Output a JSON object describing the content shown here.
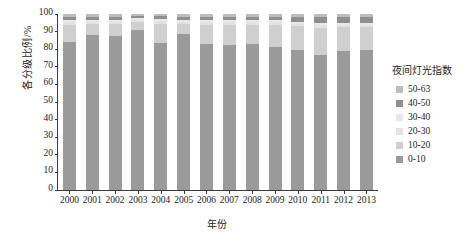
{
  "chart_data": {
    "type": "bar",
    "stacked": true,
    "title": "",
    "xlabel": "年份",
    "ylabel": "各分级比例/%",
    "ylim": [
      0,
      100
    ],
    "yticks": [
      0,
      10,
      20,
      30,
      40,
      50,
      60,
      70,
      80,
      90,
      100
    ],
    "grid": false,
    "legend_position": "right",
    "legend_title": "夜间灯光指数",
    "categories": [
      "2000",
      "2001",
      "2002",
      "2003",
      "2004",
      "2005",
      "2006",
      "2007",
      "2008",
      "2009",
      "2010",
      "2011",
      "2012",
      "2013"
    ],
    "series": [
      {
        "name": "0-10",
        "color": "#9a9a9a",
        "values": [
          84.0,
          88.0,
          87.5,
          91.0,
          83.5,
          88.5,
          83.0,
          82.5,
          83.0,
          81.5,
          79.5,
          76.5,
          79.0,
          79.5
        ]
      },
      {
        "name": "10-20",
        "color": "#cfcfcf",
        "values": [
          10.0,
          6.5,
          7.0,
          4.5,
          11.0,
          6.0,
          11.0,
          11.5,
          11.0,
          12.5,
          13.5,
          15.5,
          13.5,
          13.0
        ]
      },
      {
        "name": "20-30",
        "color": "#e2e2e2",
        "values": [
          1.5,
          1.0,
          1.0,
          1.0,
          1.5,
          1.0,
          1.5,
          1.5,
          1.5,
          1.5,
          1.5,
          2.0,
          1.5,
          1.5
        ]
      },
      {
        "name": "30-40",
        "color": "#e8e8e8",
        "values": [
          1.0,
          1.0,
          1.0,
          1.0,
          1.0,
          1.0,
          1.0,
          1.0,
          1.0,
          1.0,
          1.0,
          1.0,
          1.0,
          1.0
        ]
      },
      {
        "name": "40-50",
        "color": "#8f8f8f",
        "values": [
          2.0,
          2.0,
          2.0,
          1.5,
          2.0,
          2.0,
          2.0,
          2.0,
          2.0,
          2.0,
          3.0,
          3.5,
          3.5,
          3.5
        ]
      },
      {
        "name": "50-63",
        "color": "#bdbdbd",
        "values": [
          1.5,
          1.5,
          1.5,
          1.0,
          1.0,
          1.5,
          1.5,
          1.5,
          1.5,
          1.5,
          1.5,
          1.5,
          1.5,
          1.5
        ]
      }
    ],
    "legend_entries": [
      {
        "label": "50-63",
        "color": "#bdbdbd"
      },
      {
        "label": "40-50",
        "color": "#8f8f8f"
      },
      {
        "label": "30-40",
        "color": "#e8e8e8"
      },
      {
        "label": "20-30",
        "color": "#e2e2e2"
      },
      {
        "label": "10-20",
        "color": "#cfcfcf"
      },
      {
        "label": "0-10",
        "color": "#9a9a9a"
      }
    ]
  }
}
